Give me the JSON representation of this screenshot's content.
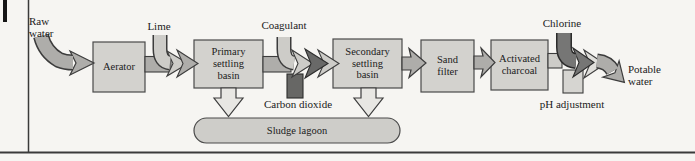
{
  "inputs": {
    "raw_water": "Raw\nwater",
    "lime": "Lime",
    "coagulant": "Coagulant",
    "carbon_dioxide": "Carbon dioxide",
    "chlorine": "Chlorine",
    "ph_adjustment": "pH adjustment"
  },
  "stages": {
    "aerator": "Aerator",
    "primary_settling_basin": "Primary\nsettling\nbasin",
    "secondary_settling_basin": "Secondary\nsettling\nbasin",
    "sand_filter": "Sand\nfilter",
    "activated_charcoal": "Activated\ncharcoal",
    "sludge_lagoon": "Sludge lagoon"
  },
  "outputs": {
    "potable_water": "Potable\nwater"
  },
  "colors": {
    "bg": "#f6f5f2",
    "text": "#1b1b1b",
    "box_fill": "#d3d2ce",
    "box_border": "#4a4a4a",
    "flow_mid": "#aeadaa",
    "flow_light": "#cdccc8",
    "flow_lighter": "#e0dfdb",
    "flow_dark": "#696968",
    "chlorine_dark": "#767675",
    "co2_dark": "#676765",
    "down_arrow_fill": "#e8e7e3",
    "lagoon_fill": "#cecdc9",
    "outline": "#3c3c3c",
    "frame_line": "#3a3a3a"
  }
}
